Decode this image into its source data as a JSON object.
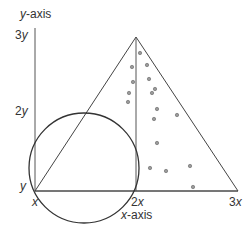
{
  "axes": {
    "y_axis_label_var": "y",
    "y_axis_label_suffix": "-axis",
    "x_axis_label_var": "x",
    "x_axis_label_suffix": "-axis"
  },
  "ticks": {
    "y": [
      {
        "coef": "3",
        "var": "y"
      },
      {
        "coef": "2",
        "var": "y"
      },
      {
        "coef": "",
        "var": "y"
      }
    ],
    "x": [
      {
        "coef": "",
        "var": "x"
      },
      {
        "coef": "2",
        "var": "x"
      },
      {
        "coef": "3",
        "var": "x"
      }
    ]
  },
  "shapes": {
    "triangle": "vertices at (x, y), (2x, 3y), (3x, y)",
    "circle": "circle centered left of 2x, passing near (x, y)",
    "segment": "vertical segment from (2x, y) to (2x, 3y)",
    "dots_count": 18
  },
  "colors": {
    "line": "#333333",
    "dot_fill": "#888888",
    "dot_stroke": "#555555"
  }
}
